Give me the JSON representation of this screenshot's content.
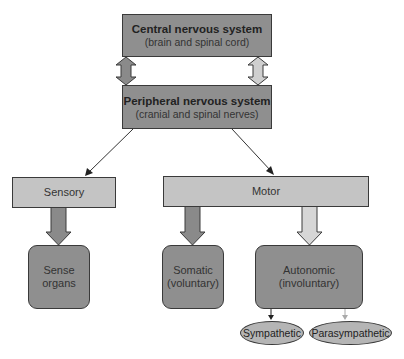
{
  "diagram": {
    "type": "hierarchy",
    "colors": {
      "dark_fill": "#8f8f8f",
      "light_fill": "#c4c4c4",
      "ellipse_fill": "#b5b5b5",
      "border": "#3a3a3a"
    },
    "cns": {
      "title": "Central nervous system",
      "subtitle": "(brain and spinal cord)"
    },
    "pns": {
      "title": "Peripheral nervous system",
      "subtitle": "(cranial and spinal nerves)"
    },
    "sensory": {
      "label": "Sensory"
    },
    "motor": {
      "label": "Motor"
    },
    "sense_organs": {
      "line1": "Sense",
      "line2": "organs"
    },
    "somatic": {
      "line1": "Somatic",
      "line2": "(voluntary)"
    },
    "autonomic": {
      "line1": "Autonomic",
      "line2": "(involuntary)"
    },
    "sympathetic": {
      "label": "Sympathetic"
    },
    "parasympathetic": {
      "label": "Parasympathetic"
    }
  }
}
